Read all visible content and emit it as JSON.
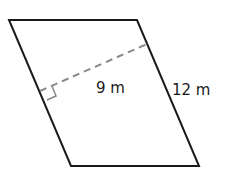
{
  "diagram": {
    "shape": "parallelogram",
    "height_label": "9 m",
    "side_label": "12 m",
    "colors": {
      "outline": "#1a1a1a",
      "dashed": "#888888"
    }
  }
}
